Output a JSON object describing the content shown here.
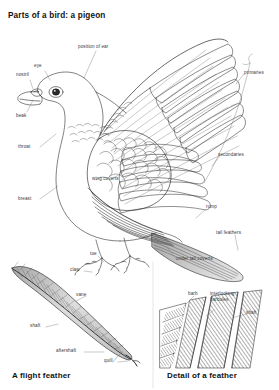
{
  "page": {
    "title": "Parts of a bird: a pigeon",
    "background_color": "#ffffff",
    "ink_color": "#1a1a1a",
    "label_color": "#3a3a3a"
  },
  "captions": {
    "left": "A flight feather",
    "right": "Detail of a feather"
  },
  "bird_labels": {
    "eye": "eye",
    "nostril": "nostril",
    "beak": "beak",
    "position_of_ear": "position of ear",
    "throat": "throat",
    "breast": "breast",
    "wing_coverts": "wing coverts",
    "primaries": "primaries",
    "secondaries": "secondaries",
    "rump": "rump",
    "tail_feathers": "tail feathers",
    "under_tail_coverts": "under tail coverts",
    "toe": "toe",
    "claw": "claw"
  },
  "flight_feather_labels": {
    "vane": "vane",
    "shaft": "shaft",
    "aftershaft": "aftershaft",
    "quill": "quill"
  },
  "feather_detail_labels": {
    "barb": "barb",
    "interlocking_barbules_line1": "interlocking",
    "interlocking_barbules_line2": "barbules",
    "shaft": "shaft"
  }
}
